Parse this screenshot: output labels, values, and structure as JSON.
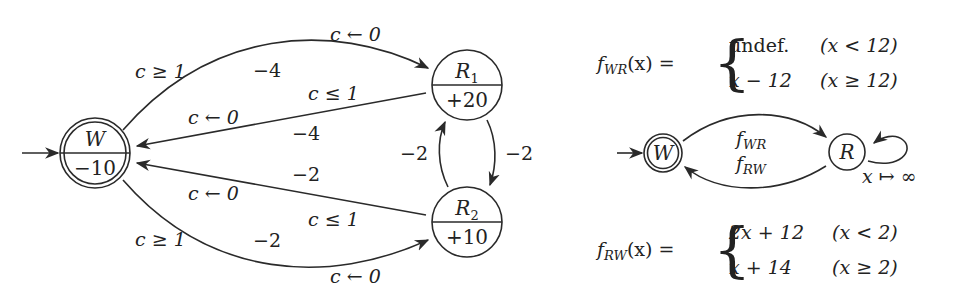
{
  "left_diagram": {
    "nodes": [
      {
        "id": "W",
        "name": "W",
        "sub": "",
        "weight": "−10",
        "accepting": true,
        "initial": true
      },
      {
        "id": "R1",
        "name": "R",
        "sub": "1",
        "weight": "+20",
        "accepting": false,
        "initial": false
      },
      {
        "id": "R2",
        "name": "R",
        "sub": "2",
        "weight": "+10",
        "accepting": false,
        "initial": false
      }
    ],
    "edges": {
      "w_r1": {
        "guard": "c ≥ 1",
        "weight": "−4",
        "reset": "c ← 0"
      },
      "r1_w": {
        "guard": "c ≤ 1",
        "weight": "−4",
        "reset": "c ← 0"
      },
      "r2_w": {
        "guard": "c ≤ 1",
        "weight": "−2",
        "reset": "c ← 0"
      },
      "w_r2": {
        "guard": "c ≥ 1",
        "weight": "−2",
        "reset": "c ← 0"
      },
      "r2_r1": {
        "weight": "−2"
      },
      "r1_r2": {
        "weight": "−2"
      }
    }
  },
  "right_diagram": {
    "f_wr": {
      "name": "f",
      "sub": "WR",
      "arg": "(x) =",
      "cases": [
        {
          "value": "undef.",
          "cond": "(x < 12)"
        },
        {
          "value": "x − 12",
          "cond": "(x ≥ 12)"
        }
      ]
    },
    "f_rw": {
      "name": "f",
      "sub": "RW",
      "arg": "(x) =",
      "cases": [
        {
          "value": "2x + 12",
          "cond": "(x < 2)"
        },
        {
          "value": "x + 14",
          "cond": "(x ≥ 2)"
        }
      ]
    },
    "nodes": [
      {
        "id": "W",
        "name": "W",
        "accepting": true,
        "initial": true
      },
      {
        "id": "R",
        "name": "R",
        "accepting": false,
        "initial": false
      }
    ],
    "edges": {
      "w_r": {
        "label_name": "f",
        "label_sub": "WR"
      },
      "r_w": {
        "label_name": "f",
        "label_sub": "RW"
      },
      "r_loop": {
        "label": "x ↦ ∞"
      }
    }
  }
}
